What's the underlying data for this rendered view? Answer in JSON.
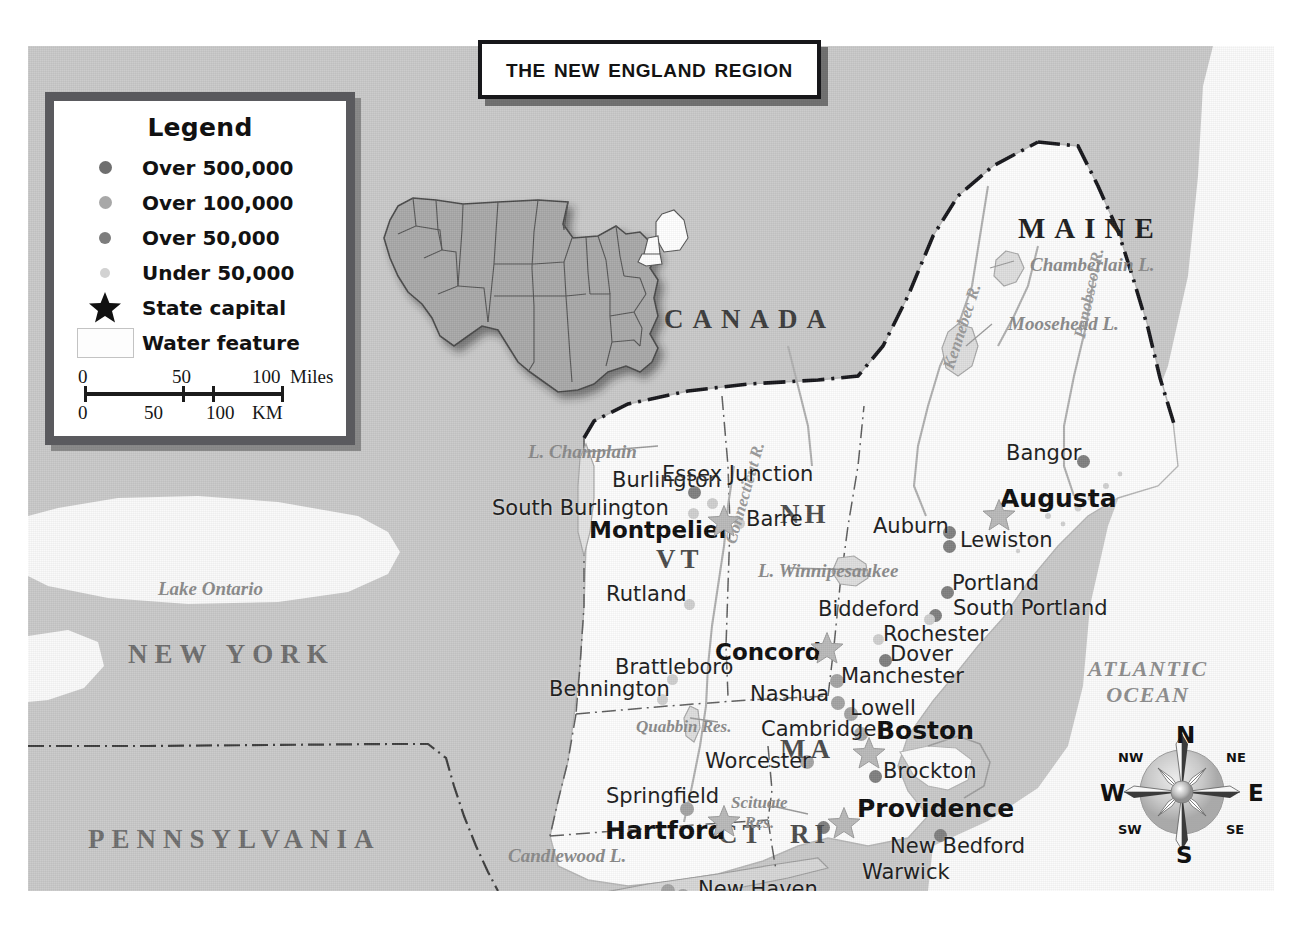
{
  "title": {
    "text": "The New England Region"
  },
  "legend": {
    "heading": "Legend",
    "items": [
      {
        "symbol": "dot-over-500k",
        "label": "Over 500,000"
      },
      {
        "symbol": "dot-over-100k",
        "label": "Over 100,000"
      },
      {
        "symbol": "dot-over-50k",
        "label": "Over 50,000"
      },
      {
        "symbol": "dot-under-50k",
        "label": "Under 50,000"
      },
      {
        "symbol": "star-icon",
        "label": "State capital"
      },
      {
        "symbol": "water-swatch",
        "label": "Water feature"
      }
    ],
    "scale": {
      "miles": {
        "ticks": [
          "0",
          "50",
          "100"
        ],
        "unit": "Miles"
      },
      "km": {
        "ticks": [
          "0",
          "50",
          "100"
        ],
        "unit": "KM"
      }
    }
  },
  "compass": {
    "n": "N",
    "ne": "NE",
    "e": "E",
    "se": "SE",
    "s": "S",
    "sw": "SW",
    "w": "W",
    "nw": "NW"
  },
  "map": {
    "countries": [
      {
        "name": "CANADA",
        "x": 636,
        "y": 260
      }
    ],
    "neighbor_states": [
      {
        "name": "NEW YORK",
        "x": 100,
        "y": 595
      },
      {
        "name": "PENNSYLVANIA",
        "x": 60,
        "y": 780
      },
      {
        "name": "MAINE",
        "x": 990,
        "y": 168
      }
    ],
    "state_abbrs": [
      {
        "name": "VT",
        "x": 628,
        "y": 500
      },
      {
        "name": "NH",
        "x": 752,
        "y": 455
      },
      {
        "name": "MA",
        "x": 752,
        "y": 690
      },
      {
        "name": "CT",
        "x": 690,
        "y": 775
      },
      {
        "name": "RI",
        "x": 762,
        "y": 775
      },
      {
        "name": "NJ",
        "x": 452,
        "y": 845
      }
    ],
    "ocean": {
      "line1": "ATLANTIC",
      "line2": "OCEAN"
    },
    "water_features": [
      {
        "name": "Lake Ontario",
        "x": 130,
        "y": 533
      },
      {
        "name": "L. Champlain",
        "x": 500,
        "y": 396
      },
      {
        "name": "Chamberlain L.",
        "x": 1002,
        "y": 209
      },
      {
        "name": "Moosehead L.",
        "x": 980,
        "y": 268
      },
      {
        "name": "L. Winnipesaukee",
        "x": 730,
        "y": 515
      },
      {
        "name": "Quabbin Res.",
        "x": 608,
        "y": 672
      },
      {
        "name": "Scituate Res.",
        "x": 703,
        "y": 748
      },
      {
        "name": "Candlewood L.",
        "x": 480,
        "y": 800
      }
    ],
    "rivers": [
      {
        "name": "Kennebec R.",
        "x": 912,
        "y": 320
      },
      {
        "name": "Penobscot R.",
        "x": 1043,
        "y": 290
      },
      {
        "name": "Connecticut R.",
        "x": 694,
        "y": 495
      }
    ],
    "capitals": [
      {
        "name": "Montpelier",
        "x": 561,
        "y": 473,
        "star_x": 679,
        "star_y": 458
      },
      {
        "name": "Augusta",
        "x": 972,
        "y": 440,
        "star_x": 954,
        "star_y": 452
      },
      {
        "name": "Concord",
        "x": 687,
        "y": 595,
        "star_x": 782,
        "star_y": 585
      },
      {
        "name": "Boston",
        "x": 848,
        "y": 672,
        "star_x": 824,
        "star_y": 690
      },
      {
        "name": "Hartford",
        "x": 577,
        "y": 772,
        "star_x": 679,
        "star_y": 758
      },
      {
        "name": "Providence",
        "x": 829,
        "y": 750,
        "star_x": 799,
        "star_y": 760
      }
    ],
    "cities": [
      {
        "name": "Burlington",
        "size": "over-50k",
        "x": 584,
        "y": 424,
        "dot_x": 660,
        "dot_y": 440
      },
      {
        "name": "South Burlington",
        "size": "under-50k",
        "x": 464,
        "y": 452,
        "dot_x": 660,
        "dot_y": 462
      },
      {
        "name": "Essex Junction",
        "size": "under-50k",
        "x": 634,
        "y": 418,
        "dot_x": 679,
        "dot_y": 452
      },
      {
        "name": "Barre",
        "size": "under-50k",
        "x": 718,
        "y": 463,
        "dot_x": 706,
        "dot_y": 472
      },
      {
        "name": "Rutland",
        "size": "under-50k",
        "x": 578,
        "y": 538,
        "dot_x": 656,
        "dot_y": 553
      },
      {
        "name": "Brattleboro",
        "size": "under-50k",
        "x": 587,
        "y": 611,
        "dot_x": 639,
        "dot_y": 628
      },
      {
        "name": "Bennington",
        "size": "under-50k",
        "x": 521,
        "y": 633,
        "dot_x": 629,
        "dot_y": 648
      },
      {
        "name": "Bangor",
        "size": "over-50k",
        "x": 978,
        "y": 397,
        "dot_x": 1049,
        "dot_y": 409
      },
      {
        "name": "Lewiston",
        "size": "over-50k",
        "x": 932,
        "y": 484,
        "dot_x": 915,
        "dot_y": 494
      },
      {
        "name": "Auburn",
        "size": "over-50k",
        "x": 845,
        "y": 470,
        "dot_x": 915,
        "dot_y": 480
      },
      {
        "name": "Portland",
        "size": "over-50k",
        "x": 924,
        "y": 527,
        "dot_x": 913,
        "dot_y": 540
      },
      {
        "name": "South Portland",
        "size": "over-50k",
        "x": 925,
        "y": 552,
        "dot_x": 901,
        "dot_y": 563
      },
      {
        "name": "Biddeford",
        "size": "under-50k",
        "x": 790,
        "y": 553,
        "dot_x": 896,
        "dot_y": 568
      },
      {
        "name": "Rochester",
        "size": "under-50k",
        "x": 855,
        "y": 578,
        "dot_x": 845,
        "dot_y": 588
      },
      {
        "name": "Dover",
        "size": "over-50k",
        "x": 862,
        "y": 598,
        "dot_x": 851,
        "dot_y": 608
      },
      {
        "name": "Manchester",
        "size": "over-100k",
        "x": 813,
        "y": 620,
        "dot_x": 802,
        "dot_y": 628
      },
      {
        "name": "Nashua",
        "size": "over-100k",
        "x": 722,
        "y": 638,
        "dot_x": 803,
        "dot_y": 650
      },
      {
        "name": "Lowell",
        "size": "over-100k",
        "x": 822,
        "y": 652,
        "dot_x": 816,
        "dot_y": 661
      },
      {
        "name": "Cambridge",
        "size": "over-100k",
        "x": 733,
        "y": 673,
        "dot_x": 826,
        "dot_y": 681
      },
      {
        "name": "Worcester",
        "size": "over-100k",
        "x": 677,
        "y": 705,
        "dot_x": 772,
        "dot_y": 709
      },
      {
        "name": "Brockton",
        "size": "over-50k",
        "x": 855,
        "y": 715,
        "dot_x": 841,
        "dot_y": 724
      },
      {
        "name": "Springfield",
        "size": "over-100k",
        "x": 578,
        "y": 740,
        "dot_x": 652,
        "dot_y": 756
      },
      {
        "name": "New Bedford",
        "size": "over-50k",
        "x": 862,
        "y": 790,
        "dot_x": 906,
        "dot_y": 783
      },
      {
        "name": "Warwick",
        "size": "over-50k",
        "x": 834,
        "y": 816,
        "dot_x": 789,
        "dot_y": 775
      },
      {
        "name": "New Haven",
        "size": "over-100k",
        "x": 670,
        "y": 833,
        "dot_x": 648,
        "dot_y": 843
      },
      {
        "name": "Bridgeport",
        "size": "over-100k",
        "x": 635,
        "y": 858,
        "dot_x": 633,
        "dot_y": 838
      },
      {
        "name": "Stamford",
        "size": "over-100k",
        "x": 507,
        "y": 853,
        "dot_x": 601,
        "dot_y": 860
      }
    ]
  }
}
